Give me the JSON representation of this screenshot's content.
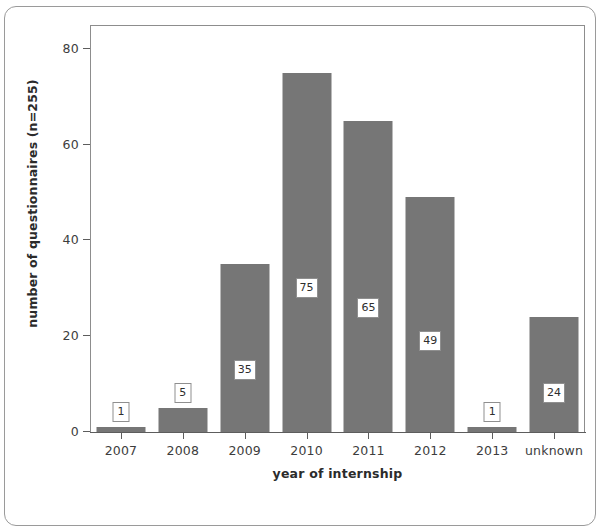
{
  "chart_data": {
    "type": "bar",
    "title": "",
    "subtitle": "",
    "xlabel": "year of internship",
    "ylabel": "number of questionnaires (n=255)",
    "categories": [
      "2007",
      "2008",
      "2009",
      "2010",
      "2011",
      "2012",
      "2013",
      "unknown"
    ],
    "values": [
      1,
      5,
      35,
      75,
      65,
      49,
      1,
      24
    ],
    "data_labels": [
      "1",
      "5",
      "35",
      "75",
      "65",
      "49",
      "1",
      "24"
    ],
    "ylim": [
      0,
      85
    ],
    "ytick_labels": [
      "0",
      "20",
      "40",
      "60",
      "80"
    ],
    "ytick_values": [
      0,
      20,
      40,
      60,
      80
    ],
    "grid": false,
    "legend": false,
    "legend_position": "none",
    "bar_color": "#767676",
    "label_box_fill": "#ffffff",
    "label_box_border": "#8f8f8f",
    "axis_color": "#5d5d5d",
    "panel_border_color": "#8d8d8d",
    "figure_border_color": "#9a9a9a",
    "total_n": 255
  }
}
